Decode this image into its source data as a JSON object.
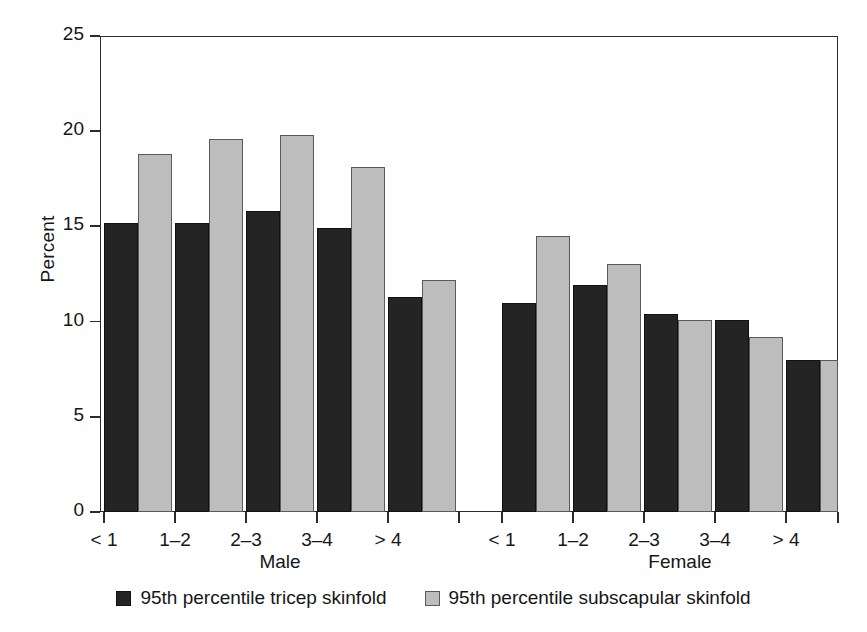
{
  "chart_data": {
    "type": "bar",
    "title": "",
    "subtitle": "",
    "xlabel": "",
    "ylabel": "Percent",
    "ylim": [
      0,
      25
    ],
    "yticks": [
      0,
      5,
      10,
      15,
      20,
      25
    ],
    "ytick_labels": [
      "0",
      "5",
      "10",
      "15",
      "20",
      "25"
    ],
    "grid": false,
    "legend_position": "bottom",
    "group_labels": [
      "Male",
      "Female"
    ],
    "categories": [
      "< 1",
      "1–2",
      "2–3",
      "3–4",
      "> 4"
    ],
    "series": [
      {
        "name": "95th percentile tricep skinfold",
        "color": "#242424",
        "groups": {
          "Male": [
            15.2,
            15.2,
            15.8,
            14.9,
            11.3
          ],
          "Female": [
            11.0,
            11.9,
            10.4,
            10.1,
            8.0
          ]
        }
      },
      {
        "name": "95th percentile subscapular skinfold",
        "color": "#bdbdbd",
        "groups": {
          "Male": [
            18.8,
            19.6,
            19.8,
            18.1,
            12.2
          ],
          "Female": [
            14.5,
            13.0,
            10.1,
            9.2,
            8.0
          ]
        }
      }
    ],
    "annotations": []
  },
  "axes": {
    "y_title": "Percent",
    "y_tick_labels": [
      "25",
      "20",
      "15",
      "10",
      "5",
      "0"
    ],
    "x_tick_labels_male": [
      "< 1",
      "1–2",
      "2–3",
      "3–4",
      "> 4"
    ],
    "x_tick_labels_female": [
      "< 1",
      "1–2",
      "2–3",
      "3–4",
      "> 4"
    ],
    "group_label_male": "Male",
    "group_label_female": "Female"
  },
  "legend": {
    "items": [
      {
        "label": "95th percentile tricep skinfold",
        "color": "#242424"
      },
      {
        "label": "95th percentile subscapular skinfold",
        "color": "#bdbdbd"
      }
    ]
  }
}
